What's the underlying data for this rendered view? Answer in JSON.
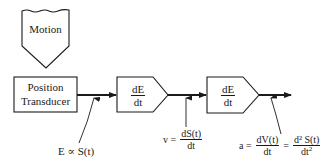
{
  "diagram": {
    "motion_block": {
      "label": "Motion"
    },
    "transducer_block": {
      "line1": "Position",
      "line2": "Transducer"
    },
    "differentiator_1": {
      "num": "dE",
      "den": "dt"
    },
    "differentiator_2": {
      "num": "dE",
      "den": "dt"
    },
    "signal_labels": {
      "position": {
        "text": "E ∝ S(t)"
      },
      "velocity": {
        "lhs": "v =",
        "num": "dS(t)",
        "den": "dt"
      },
      "acceleration": {
        "lhs": "a =",
        "num1": "dV(t)",
        "den1": "dt",
        "eq2": "=",
        "num2": "d² S(t)",
        "den2_base": "dt",
        "den2_sup": "2"
      }
    },
    "colors": {
      "line": "#1a1a1a",
      "background": "#ffffff"
    }
  }
}
